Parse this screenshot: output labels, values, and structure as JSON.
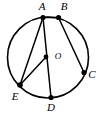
{
  "figure": {
    "background_color": "#ffffff",
    "stroke_color": "#000000",
    "circle": {
      "center_x": 48,
      "center_y": 57.5,
      "radius": 40.5,
      "center_label": "O"
    },
    "points": [
      {
        "id": "A",
        "label": "A",
        "x": 43,
        "y": 17.5,
        "label_x": 42,
        "label_y": 7
      },
      {
        "id": "B",
        "label": "B",
        "x": 58.5,
        "y": 17.5,
        "label_x": 64,
        "label_y": 7
      },
      {
        "id": "C",
        "label": "C",
        "x": 84,
        "y": 72.5,
        "label_x": 92,
        "label_y": 75
      },
      {
        "id": "D",
        "label": "D",
        "x": 51,
        "y": 97.5,
        "label_x": 51,
        "label_y": 108
      },
      {
        "id": "E",
        "label": "E",
        "x": 20,
        "y": 85,
        "label_x": 15,
        "label_y": 97
      },
      {
        "id": "O",
        "label": "O",
        "x": 46,
        "y": 57,
        "label_x": 58,
        "label_y": 57
      }
    ],
    "segments": [
      {
        "id": "A-B",
        "from": "A",
        "to": "B"
      },
      {
        "id": "B-C",
        "from": "B",
        "to": "C"
      },
      {
        "id": "A-E",
        "from": "A",
        "to": "E"
      },
      {
        "id": "A-D",
        "from": "A",
        "to": "D"
      },
      {
        "id": "O-E",
        "from": "O",
        "to": "E"
      }
    ]
  }
}
